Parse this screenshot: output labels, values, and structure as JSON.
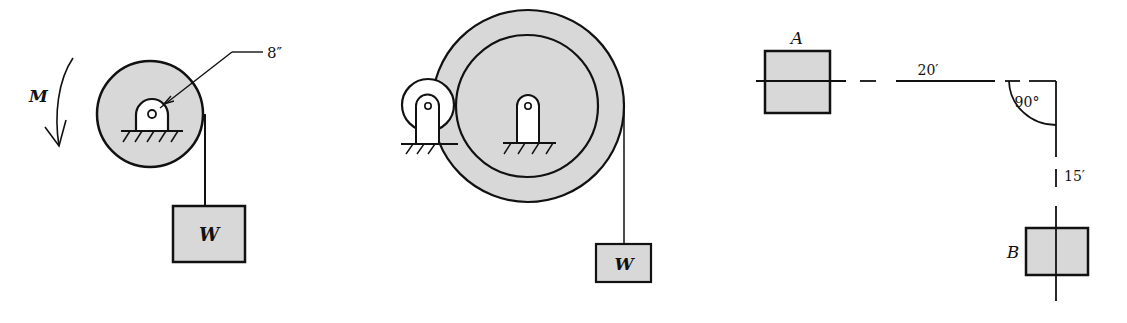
{
  "figure_1": {
    "moment_label": "M",
    "radius_label": "8″",
    "weight_label": "W"
  },
  "figure_2": {
    "weight_label": "W"
  },
  "figure_3": {
    "point_a_label": "A",
    "point_b_label": "B",
    "horizontal_distance_label": "20′",
    "vertical_distance_label": "15′",
    "angle_label": "90°"
  },
  "colors": {
    "line": "#111111",
    "shading": "#d8d8d8",
    "background": "#ffffff"
  }
}
